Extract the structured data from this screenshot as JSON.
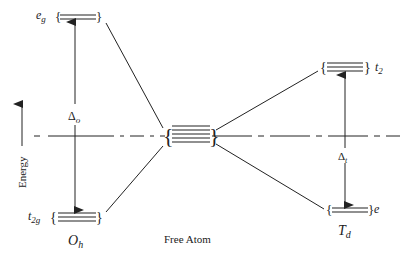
{
  "diagram": {
    "axis": {
      "label": "Energy"
    },
    "octahedral": {
      "symmetry_label": "O",
      "symmetry_sub": "h",
      "upper": {
        "label": "e",
        "sub": "g",
        "degeneracy": 2
      },
      "lower": {
        "label": "t",
        "sub": "2g",
        "degeneracy": 3
      },
      "splitting": {
        "symbol": "Δ",
        "sub": "o"
      }
    },
    "free_atom": {
      "label": "Free Atom",
      "degeneracy": 5
    },
    "tetrahedral": {
      "symmetry_label": "T",
      "symmetry_sub": "d",
      "upper": {
        "label": "t",
        "sub": "2",
        "degeneracy": 3
      },
      "lower": {
        "label": "e",
        "sub": "",
        "degeneracy": 2
      },
      "splitting": {
        "symbol": "Δ",
        "sub": "t"
      }
    },
    "colors": {
      "line": "#222222",
      "background": "#ffffff"
    }
  }
}
